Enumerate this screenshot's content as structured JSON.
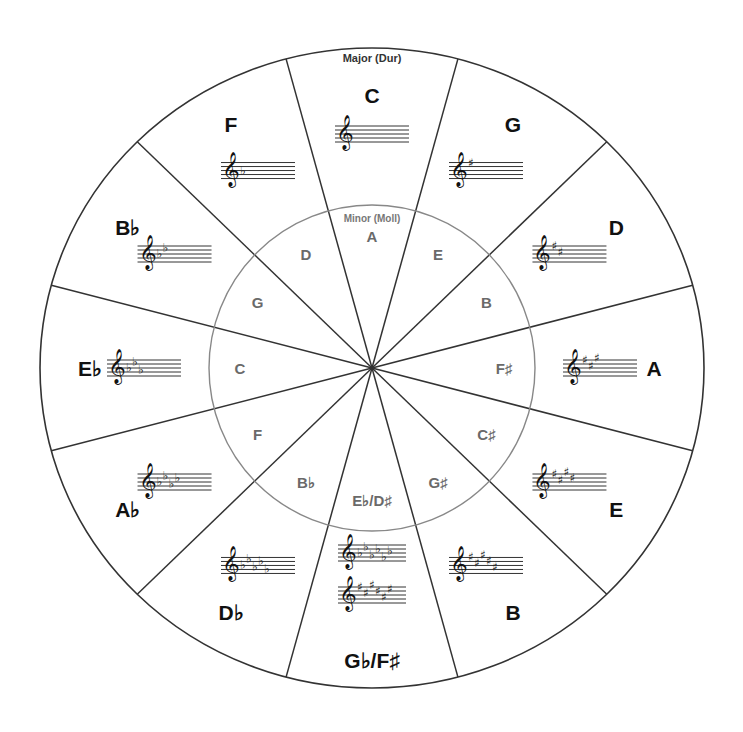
{
  "diagram": {
    "outer_ring_title": "Major (Dur)",
    "inner_ring_title": "Minor (Moll)",
    "colors": {
      "outer_line": "#333333",
      "inner_circle": "#888888",
      "major_text": "#111111",
      "minor_text": "#6a6a6a",
      "background": "#ffffff"
    },
    "keys": [
      {
        "position": 0,
        "major": "C",
        "minor": "A",
        "accidental_type": "none",
        "accidental_count": 0,
        "staves": [
          {
            "type": "none",
            "count": 0
          }
        ]
      },
      {
        "position": 1,
        "major": "G",
        "minor": "E",
        "accidental_type": "sharp",
        "accidental_count": 1,
        "staves": [
          {
            "type": "sharp",
            "count": 1
          }
        ]
      },
      {
        "position": 2,
        "major": "D",
        "minor": "B",
        "accidental_type": "sharp",
        "accidental_count": 2,
        "staves": [
          {
            "type": "sharp",
            "count": 2
          }
        ]
      },
      {
        "position": 3,
        "major": "A",
        "minor": "F♯",
        "accidental_type": "sharp",
        "accidental_count": 3,
        "staves": [
          {
            "type": "sharp",
            "count": 3
          }
        ]
      },
      {
        "position": 4,
        "major": "E",
        "minor": "C♯",
        "accidental_type": "sharp",
        "accidental_count": 4,
        "staves": [
          {
            "type": "sharp",
            "count": 4
          }
        ]
      },
      {
        "position": 5,
        "major": "B",
        "minor": "G♯",
        "accidental_type": "sharp",
        "accidental_count": 5,
        "staves": [
          {
            "type": "sharp",
            "count": 5
          }
        ]
      },
      {
        "position": 6,
        "major": "G♭/F♯",
        "minor": "E♭/D♯",
        "accidental_type": "both",
        "accidental_count": 6,
        "staves": [
          {
            "type": "flat",
            "count": 6
          },
          {
            "type": "sharp",
            "count": 6
          }
        ]
      },
      {
        "position": 7,
        "major": "D♭",
        "minor": "B♭",
        "accidental_type": "flat",
        "accidental_count": 5,
        "staves": [
          {
            "type": "flat",
            "count": 5
          }
        ]
      },
      {
        "position": 8,
        "major": "A♭",
        "minor": "F",
        "accidental_type": "flat",
        "accidental_count": 4,
        "staves": [
          {
            "type": "flat",
            "count": 4
          }
        ]
      },
      {
        "position": 9,
        "major": "E♭",
        "minor": "C",
        "accidental_type": "flat",
        "accidental_count": 3,
        "staves": [
          {
            "type": "flat",
            "count": 3
          }
        ]
      },
      {
        "position": 10,
        "major": "B♭",
        "minor": "G",
        "accidental_type": "flat",
        "accidental_count": 2,
        "staves": [
          {
            "type": "flat",
            "count": 2
          }
        ]
      },
      {
        "position": 11,
        "major": "F",
        "minor": "D",
        "accidental_type": "flat",
        "accidental_count": 1,
        "staves": [
          {
            "type": "flat",
            "count": 1
          }
        ]
      }
    ],
    "glyphs": {
      "treble_clef": "𝄞",
      "sharp": "♯",
      "flat": "♭"
    }
  }
}
